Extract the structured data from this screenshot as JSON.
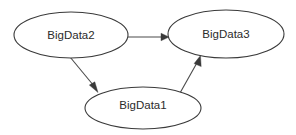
{
  "diagram": {
    "type": "directed-graph",
    "background_color": "#ffffff",
    "node_fill_color": "#ffffff",
    "node_stroke_color": "#3a3a3a",
    "edge_color": "#4a4a4a",
    "label_color": "#2b2b2b",
    "nodes": [
      {
        "id": "bigdata2",
        "label": "BigData2",
        "shape": "ellipse",
        "cx": 71,
        "cy": 35,
        "rx": 57,
        "ry": 23
      },
      {
        "id": "bigdata3",
        "label": "BigData3",
        "shape": "ellipse",
        "cx": 226,
        "cy": 34,
        "rx": 58,
        "ry": 24
      },
      {
        "id": "bigdata1",
        "label": "BigData1",
        "shape": "ellipse",
        "cx": 143,
        "cy": 108,
        "rx": 58,
        "ry": 21
      }
    ],
    "edges": [
      {
        "id": "edge-bigdata2-bigdata3",
        "from": "BigData2",
        "to": "BigData3",
        "direction": "right",
        "x1": 128,
        "y1": 37,
        "x2": 166,
        "y2": 37
      },
      {
        "id": "edge-bigdata2-bigdata1",
        "from": "BigData2",
        "to": "BigData1",
        "direction": "down-right",
        "x1": 70,
        "y1": 57,
        "x2": 97,
        "y2": 90
      },
      {
        "id": "edge-bigdata1-bigdata3",
        "from": "BigData1",
        "to": "BigData3",
        "direction": "up-right",
        "x1": 180,
        "y1": 93,
        "x2": 199,
        "y2": 58
      }
    ]
  }
}
